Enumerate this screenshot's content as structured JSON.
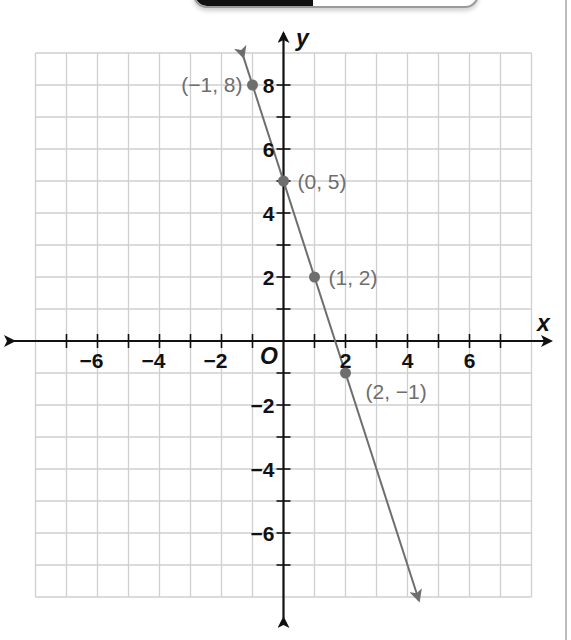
{
  "chart_data": {
    "type": "line",
    "title": "",
    "xlabel": "x",
    "ylabel": "y",
    "origin_label": "O",
    "xlim": [
      -8,
      8
    ],
    "ylim": [
      -8,
      9
    ],
    "grid": true,
    "x_tick_labels": [
      {
        "value": -6,
        "label": "−6"
      },
      {
        "value": -4,
        "label": "−4"
      },
      {
        "value": -2,
        "label": "−2"
      },
      {
        "value": 2,
        "label": "2"
      },
      {
        "value": 4,
        "label": "4"
      },
      {
        "value": 6,
        "label": "6"
      }
    ],
    "y_tick_labels": [
      {
        "value": 8,
        "label": "8"
      },
      {
        "value": 6,
        "label": "6"
      },
      {
        "value": 4,
        "label": "4"
      },
      {
        "value": 2,
        "label": "2"
      },
      {
        "value": -2,
        "label": "−2"
      },
      {
        "value": -4,
        "label": "−4"
      },
      {
        "value": -6,
        "label": "−6"
      }
    ],
    "series": [
      {
        "name": "line",
        "equation": "y = -3x + 5",
        "slope": -3,
        "intercept": 5,
        "color": "#6e6e6e",
        "arrows_both_ends": true,
        "x_range": [
          -1.29,
          4.37
        ]
      }
    ],
    "points": [
      {
        "x": -1,
        "y": 8,
        "label": "(−1, 8)"
      },
      {
        "x": 0,
        "y": 5,
        "label": "(0, 5)"
      },
      {
        "x": 1,
        "y": 2,
        "label": "(1, 2)"
      },
      {
        "x": 2,
        "y": -1,
        "label": "(2, −1)"
      }
    ]
  },
  "colors": {
    "grid": "#cfcfcf",
    "axis": "#111111",
    "line": "#6e6e6e",
    "point_label": "#6e6e6e"
  }
}
